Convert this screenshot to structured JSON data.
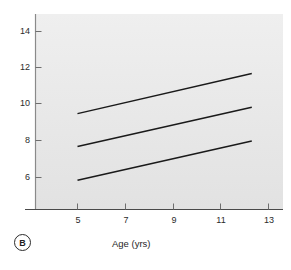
{
  "panel": {
    "label": "B"
  },
  "chart_data": {
    "type": "line",
    "title": "",
    "subtitle": "",
    "xlabel": "Age (yrs)",
    "ylabel": "",
    "xlim": [
      4.0,
      13.6
    ],
    "ylim": [
      4.9,
      14.8
    ],
    "xticks": [
      5,
      7,
      9,
      11,
      13
    ],
    "xticklabels": [
      "5",
      "7",
      "9",
      "11",
      "13"
    ],
    "yticks": [
      6,
      8,
      10,
      12,
      14
    ],
    "yticklabels": [
      "6",
      "8",
      "10",
      "12",
      "14"
    ],
    "grid": false,
    "legend": null,
    "legend_position": "none",
    "background": "#e9e9e9",
    "line_color": "#1a1a1a",
    "series": [
      {
        "name": "upper",
        "x": [
          5.0,
          12.3
        ],
        "values": [
          9.5,
          11.7
        ]
      },
      {
        "name": "middle",
        "x": [
          5.0,
          12.3
        ],
        "values": [
          7.7,
          9.85
        ]
      },
      {
        "name": "lower",
        "x": [
          5.0,
          12.3
        ],
        "values": [
          5.85,
          8.0
        ]
      }
    ]
  }
}
